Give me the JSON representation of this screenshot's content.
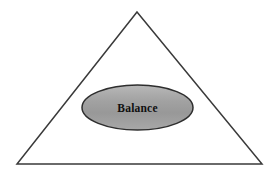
{
  "diagram": {
    "background_color": "#ffffff",
    "title": "",
    "shapes": {
      "triangle": {
        "name": "triangle-outline",
        "label": "",
        "stroke_color": "#3a3a3a",
        "fill_color": "none",
        "stroke_width": 1.5,
        "apex": {
          "x": 137,
          "y": 12
        },
        "bottom_left": {
          "x": 17,
          "y": 164
        },
        "bottom_right": {
          "x": 262,
          "y": 164
        }
      },
      "ellipse": {
        "name": "balance-ellipse",
        "label": "Balance",
        "stroke_color": "#2e2e2e",
        "stroke_width": 1.5,
        "fill_top_color": "#b4b4b4",
        "fill_mid_color": "#9c9c9c",
        "fill_bottom_color": "#a6a6a6",
        "text_color": "#101010",
        "center": {
          "x": 137.5,
          "y": 107.5
        },
        "radius_x": 55.5,
        "radius_y": 22.5
      }
    }
  }
}
